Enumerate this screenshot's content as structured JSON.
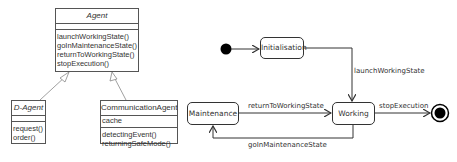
{
  "class_diagram": {
    "agent": {
      "name": "Agent",
      "attributes": [],
      "operations": [
        "launchWorkingState()",
        "goInMaintenanceState()",
        "returnToWorkingState()",
        "stopExecution()"
      ]
    },
    "d_agent": {
      "name": "D-Agent",
      "attributes": [],
      "operations": [
        "request()",
        "order()"
      ]
    },
    "communication_agent": {
      "name": "CommunicationAgent",
      "attributes": [
        "cache"
      ],
      "operations": [
        "detectingEvent()",
        "returningSafeMode()"
      ]
    }
  },
  "state_diagram": {
    "states": {
      "initialisation": "Initialisation",
      "maintenance": "Maintenance",
      "working": "Working"
    },
    "transitions": {
      "launch": "launchWorkingState",
      "return_to_working": "returnToWorkingState",
      "stop": "stopExecution",
      "go_maintenance": "goInMaintenanceState"
    }
  }
}
